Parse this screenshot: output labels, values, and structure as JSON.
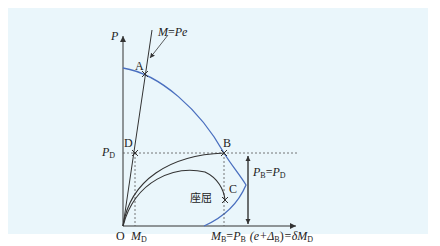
{
  "diagram": {
    "axes": {
      "y_label": "P",
      "x_label": "",
      "origin_label": "O"
    },
    "line_label": {
      "lhs": "M",
      "eq": "=",
      "rhs": "Pe"
    },
    "points": {
      "A": "A",
      "B": "B",
      "C": "C",
      "D": "D"
    },
    "p_d_label": {
      "main": "P",
      "sub": "D"
    },
    "m_d_label": {
      "main": "M",
      "sub": "D"
    },
    "buckling_label": "座屈",
    "pb_eq_pd": {
      "p1": "P",
      "s1": "B",
      "eq": "=",
      "p2": "P",
      "s2": "D"
    },
    "mb_equation": {
      "m": "M",
      "ms": "B",
      "eq1": "=",
      "p": "P",
      "ps": "B",
      "paren": "(e+Δ",
      "ds": "B",
      "close": ")",
      "eq2": "=δM",
      "ends": "D"
    },
    "colors": {
      "panel_bg": "#eaf6fb",
      "interaction_curve": "#4a6fbf",
      "black_lines": "#333333",
      "dashed": "#555555"
    }
  }
}
